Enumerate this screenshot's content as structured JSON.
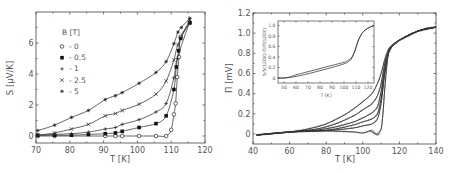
{
  "chart_data": [
    {
      "type": "line",
      "title": "",
      "xlabel": "T [K]",
      "ylabel": "S [μV/K]",
      "xlim": [
        70,
        120
      ],
      "ylim": [
        -0.45,
        7.9
      ],
      "xticks": [
        70,
        80,
        90,
        100,
        110,
        120
      ],
      "yticks": [
        0,
        2,
        4,
        6
      ],
      "grid": false,
      "legend": {
        "title": "B [T]",
        "position": "upper-left",
        "entries": [
          {
            "marker": "open-circle",
            "label": "- 0"
          },
          {
            "marker": "filled-square",
            "label": "- 0.5"
          },
          {
            "marker": "plus",
            "label": "- 1"
          },
          {
            "marker": "cross",
            "label": "- 2.5"
          },
          {
            "marker": "asterisk",
            "label": "- 5"
          }
        ]
      },
      "series": [
        {
          "name": "0",
          "marker": "open-circle",
          "x": [
            70.5,
            75.5,
            90.5,
            93.5,
            95.5,
            100.5,
            105.5,
            108.5,
            110,
            110.8,
            111.3,
            111.8,
            112.3,
            112.8,
            115.5
          ],
          "y": [
            0,
            0,
            0,
            0,
            0,
            0,
            0,
            0,
            0.4,
            1.4,
            2.1,
            3.8,
            5.1,
            6.4,
            7.3
          ]
        },
        {
          "name": "0.5",
          "marker": "filled-square",
          "x": [
            70.5,
            75.5,
            80.5,
            85.5,
            90.5,
            93.5,
            95.5,
            100.5,
            105.5,
            108.5,
            110.8,
            111.5,
            112.2,
            112.8,
            115.5
          ],
          "y": [
            0.05,
            0.05,
            0.05,
            0.1,
            0.15,
            0.2,
            0.3,
            0.55,
            0.8,
            1.3,
            3.0,
            4.45,
            5.5,
            6.3,
            7.3
          ]
        },
        {
          "name": "1",
          "marker": "plus",
          "x": [
            70.5,
            75.5,
            80.5,
            85.5,
            90.5,
            93.5,
            95.5,
            100.5,
            105.5,
            108.5,
            110.8,
            111.8,
            115.5
          ],
          "y": [
            0.05,
            0.1,
            0.15,
            0.25,
            0.45,
            0.55,
            0.75,
            1.05,
            1.55,
            2.1,
            3.75,
            5.0,
            7.4
          ]
        },
        {
          "name": "2.5",
          "marker": "cross",
          "x": [
            70.5,
            75.5,
            80.5,
            85.5,
            90.5,
            93.5,
            95.5,
            100.5,
            105.5,
            108.5,
            110.8,
            112.0,
            115.5
          ],
          "y": [
            0.05,
            0.2,
            0.45,
            0.75,
            1.3,
            1.45,
            1.65,
            2.05,
            2.7,
            3.55,
            4.9,
            5.9,
            7.5
          ]
        },
        {
          "name": "5",
          "marker": "asterisk",
          "x": [
            70.5,
            75.5,
            80.5,
            85.5,
            90.5,
            93.5,
            95.5,
            100.5,
            105.5,
            108.5,
            110.8,
            112.0,
            113.0,
            115.5
          ],
          "y": [
            0.35,
            0.7,
            1.2,
            1.65,
            2.35,
            2.6,
            2.8,
            3.4,
            4.1,
            4.8,
            5.95,
            6.7,
            7.0,
            7.6
          ]
        }
      ]
    },
    {
      "type": "line",
      "title": "",
      "xlabel": "T [K]",
      "ylabel": "Π [mV]",
      "xlim": [
        40,
        140
      ],
      "ylim": [
        -0.1,
        1.2
      ],
      "xticks": [
        40,
        60,
        80,
        100,
        120,
        140
      ],
      "yticks": [
        0,
        0.2,
        0.4,
        0.6,
        0.8,
        1.0,
        1.2
      ],
      "grid": false,
      "series": [
        {
          "name": "B=0",
          "x": [
            42,
            60,
            80,
            95,
            100,
            104,
            106,
            108,
            110,
            111,
            112,
            113,
            114,
            116,
            120,
            125,
            130,
            135,
            140
          ],
          "y": [
            -0.01,
            0.02,
            0.03,
            0.02,
            0.01,
            0.03,
            0.01,
            0.0,
            0.05,
            0.2,
            0.45,
            0.65,
            0.8,
            0.87,
            0.93,
            0.98,
            1.02,
            1.05,
            1.06
          ]
        },
        {
          "name": "B=0.5",
          "x": [
            42,
            60,
            75,
            85,
            95,
            100,
            105,
            108,
            110,
            112,
            114,
            116,
            120,
            130,
            140
          ],
          "y": [
            -0.01,
            0.02,
            0.03,
            0.04,
            0.06,
            0.08,
            0.1,
            0.15,
            0.3,
            0.6,
            0.8,
            0.87,
            0.93,
            1.02,
            1.06
          ]
        },
        {
          "name": "B=1",
          "x": [
            42,
            60,
            75,
            85,
            95,
            100,
            105,
            108,
            110,
            112,
            114,
            116,
            120,
            130,
            140
          ],
          "y": [
            -0.01,
            0.02,
            0.03,
            0.05,
            0.09,
            0.12,
            0.15,
            0.2,
            0.35,
            0.62,
            0.8,
            0.87,
            0.93,
            1.02,
            1.06
          ]
        },
        {
          "name": "B=2.5",
          "x": [
            42,
            60,
            75,
            85,
            95,
            100,
            105,
            108,
            110,
            112,
            114,
            116,
            120,
            130,
            140
          ],
          "y": [
            -0.01,
            0.02,
            0.04,
            0.07,
            0.12,
            0.16,
            0.21,
            0.27,
            0.42,
            0.66,
            0.81,
            0.87,
            0.93,
            1.02,
            1.06
          ]
        },
        {
          "name": "B=5",
          "x": [
            42,
            60,
            75,
            85,
            95,
            100,
            105,
            108,
            110,
            112,
            114,
            116,
            120,
            130,
            140
          ],
          "y": [
            -0.01,
            0.02,
            0.05,
            0.1,
            0.18,
            0.24,
            0.3,
            0.38,
            0.5,
            0.7,
            0.82,
            0.88,
            0.93,
            1.02,
            1.06
          ]
        },
        {
          "name": "B=8",
          "x": [
            42,
            60,
            70,
            80,
            90,
            95,
            100,
            105,
            108,
            110,
            112,
            114,
            116,
            120,
            130,
            140
          ],
          "y": [
            -0.01,
            0.02,
            0.05,
            0.1,
            0.19,
            0.25,
            0.32,
            0.4,
            0.5,
            0.6,
            0.74,
            0.84,
            0.88,
            0.93,
            1.02,
            1.06
          ]
        }
      ],
      "inset": {
        "type": "line",
        "xlabel": "T [K]",
        "ylabel": "S/S(120K)   Π/Π(120K)",
        "xlim": [
          45,
          125
        ],
        "ylim": [
          -0.08,
          1.08
        ],
        "xticks": [
          50,
          60,
          70,
          80,
          90,
          100,
          110,
          120
        ],
        "yticks": [
          0,
          0.2,
          0.4,
          0.6,
          0.8,
          1.0
        ],
        "series": [
          {
            "name": "S/S(120K)",
            "x": [
              45,
              50,
              55,
              60,
              70,
              80,
              90,
              100,
              103,
              106,
              108,
              110,
              112,
              115,
              118,
              121,
              125
            ],
            "y": [
              0.0,
              0.0,
              0.01,
              0.03,
              0.08,
              0.14,
              0.2,
              0.27,
              0.3,
              0.36,
              0.45,
              0.58,
              0.72,
              0.85,
              0.92,
              0.96,
              1.0
            ]
          },
          {
            "name": "Π/Π(120K)",
            "x": [
              45,
              50,
              55,
              60,
              70,
              80,
              90,
              100,
              103,
              106,
              108,
              110,
              112,
              115,
              118,
              121,
              125
            ],
            "y": [
              0.0,
              0.0,
              0.02,
              0.06,
              0.12,
              0.18,
              0.24,
              0.3,
              0.33,
              0.38,
              0.46,
              0.58,
              0.72,
              0.85,
              0.92,
              0.96,
              1.0
            ]
          }
        ]
      }
    }
  ],
  "left": {
    "xlabel": "T [K]",
    "ylabel": "S [μV/K]",
    "xtick_labels": [
      "70",
      "80",
      "90",
      "100",
      "110",
      "120"
    ],
    "ytick_labels": [
      "0",
      "2",
      "4",
      "6"
    ],
    "legend_title": "B [T]",
    "legend_labels": [
      "- 0",
      "- 0.5",
      "- 1",
      "- 2.5",
      "- 5"
    ]
  },
  "right": {
    "xlabel": "T [K]",
    "ylabel": "Π [mV]",
    "xtick_labels": [
      "40",
      "60",
      "80",
      "100",
      "120",
      "140"
    ],
    "ytick_labels": [
      "0",
      "0.2",
      "0.4",
      "0.6",
      "0.8",
      "1.0",
      "1.2"
    ],
    "inset_xlabel": "T [K]",
    "inset_ylabel": "S/S(120K)   Π/Π(120K)",
    "inset_xtick_labels": [
      "50",
      "60",
      "70",
      "80",
      "90",
      "100",
      "110",
      "120"
    ],
    "inset_ytick_labels": [
      "0",
      "0.2",
      "0.4",
      "0.6",
      "0.8",
      "1.0"
    ]
  }
}
